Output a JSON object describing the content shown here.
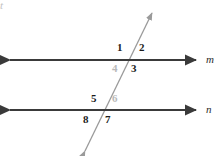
{
  "figure": {
    "background_color": "#ffffff"
  },
  "lines": [
    {
      "id": "line-m",
      "name": "m",
      "label_color": "#2a2a2a",
      "stroke_color": "#3a3a3a",
      "label_x": 206,
      "label_y": 54,
      "x1": 10,
      "y1": 60,
      "x2": 196,
      "y2": 60,
      "arrows": "both"
    },
    {
      "id": "line-n",
      "name": "n",
      "label_color": "#2a2a2a",
      "stroke_color": "#3a3a3a",
      "label_x": 206,
      "label_y": 104,
      "x1": 10,
      "y1": 110,
      "x2": 196,
      "y2": 110,
      "arrows": "both"
    },
    {
      "id": "transversal-t",
      "name": "t",
      "label_color": "#c2c2c2",
      "stroke_color": "#9a9a9a",
      "label_x": 154,
      "label_y": 3,
      "x1": 85,
      "y1": 151,
      "x2": 152,
      "y2": 13,
      "arrows": "both"
    }
  ],
  "angle_labels": [
    {
      "id": "angle-1",
      "text": "1",
      "x": 117,
      "y": 42,
      "faint": false
    },
    {
      "id": "angle-2",
      "text": "2",
      "x": 139,
      "y": 42,
      "faint": false
    },
    {
      "id": "angle-3",
      "text": "3",
      "x": 131,
      "y": 63,
      "faint": false
    },
    {
      "id": "angle-4",
      "text": "4",
      "x": 112,
      "y": 63,
      "faint": true
    },
    {
      "id": "angle-5",
      "text": "5",
      "x": 91,
      "y": 93,
      "faint": false
    },
    {
      "id": "angle-6",
      "text": "6",
      "x": 112,
      "y": 93,
      "faint": true
    },
    {
      "id": "angle-7",
      "text": "7",
      "x": 105,
      "y": 114,
      "faint": false
    },
    {
      "id": "angle-8",
      "text": "8",
      "x": 83,
      "y": 114,
      "faint": false
    }
  ],
  "intersections": [
    {
      "id": "intersection-m-t",
      "x": 128,
      "y": 60
    },
    {
      "id": "intersection-n-t",
      "x": 104,
      "y": 110
    }
  ]
}
